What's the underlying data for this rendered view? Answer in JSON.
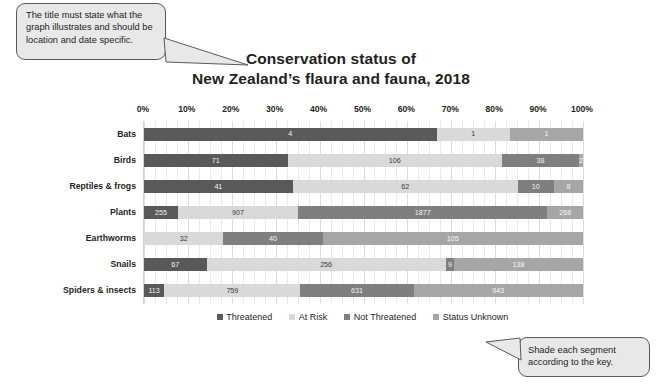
{
  "callouts": {
    "title_note": "The title must state what the graph illustrates and should be location and date specific.",
    "key_note": "Shade each segment according to the key."
  },
  "title": {
    "line1": "Conservation status of",
    "line2": "New Zealand’s flaura and fauna, 2018"
  },
  "colors": {
    "threatened": "#595959",
    "at_risk": "#d9d9d9",
    "not_threatened": "#7f7f7f",
    "status_unknown": "#a6a6a6",
    "gridline": "#dcdcdc",
    "callout_fill": "#e8e8e8",
    "callout_border": "#58595b"
  },
  "chart_data": {
    "type": "bar",
    "orientation": "horizontal",
    "stacked": true,
    "normalized": true,
    "title": "Conservation status of New Zealand’s flaura and fauna, 2018",
    "xlabel": "",
    "ylabel": "",
    "xlim": [
      0,
      100
    ],
    "xticks": [
      "0%",
      "10%",
      "20%",
      "30%",
      "40%",
      "50%",
      "60%",
      "70%",
      "80%",
      "90%",
      "100%"
    ],
    "grid": true,
    "legend_position": "bottom",
    "categories": [
      "Bats",
      "Birds",
      "Reptiles & frogs",
      "Plants",
      "Earthworms",
      "Snails",
      "Spiders & insects"
    ],
    "series": [
      {
        "name": "Threatened",
        "values": [
          4,
          71,
          41,
          255,
          0,
          67,
          113
        ]
      },
      {
        "name": "At Risk",
        "values": [
          1,
          106,
          62,
          907,
          32,
          256,
          759
        ]
      },
      {
        "name": "Not Threatened",
        "values": [
          0,
          38,
          10,
          1877,
          40,
          9,
          631
        ]
      },
      {
        "name": "Status Unknown",
        "values": [
          1,
          2,
          8,
          268,
          105,
          138,
          943
        ]
      }
    ]
  },
  "legend": {
    "items": [
      {
        "label": "Threatened",
        "color": "#595959"
      },
      {
        "label": "At Risk",
        "color": "#d9d9d9"
      },
      {
        "label": "Not Threatened",
        "color": "#7f7f7f"
      },
      {
        "label": "Status Unknown",
        "color": "#a6a6a6"
      }
    ]
  }
}
